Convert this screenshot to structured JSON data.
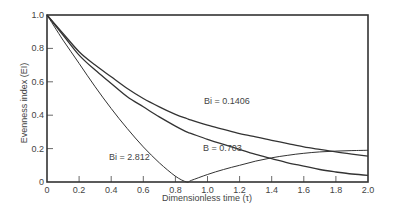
{
  "chart_data": {
    "type": "line",
    "title": "",
    "xlabel": "Dimensionless time (τ)",
    "ylabel": "Evenness index (EI)",
    "xlim": [
      0,
      2.0
    ],
    "ylim": [
      0,
      1.0
    ],
    "grid": false,
    "legend": "none (inline curve labels)",
    "x_ticks": [
      "0",
      "0.2",
      "0.4",
      "0.6",
      "0.8",
      "1.0",
      "1.2",
      "1.4",
      "1.6",
      "1.8",
      "2.0"
    ],
    "y_ticks": [
      "0",
      "0.2",
      "0.4",
      "0.6",
      "0.8",
      "1.0"
    ],
    "x": [
      0,
      0.1,
      0.2,
      0.3,
      0.4,
      0.5,
      0.6,
      0.7,
      0.8,
      0.87,
      0.9,
      1.0,
      1.1,
      1.2,
      1.3,
      1.4,
      1.5,
      1.6,
      1.7,
      1.8,
      1.9,
      2.0
    ],
    "series": [
      {
        "name": "Bi = 0.1406",
        "label_text": "Bi = 0.1406",
        "values": [
          1.0,
          0.89,
          0.78,
          0.7,
          0.63,
          0.56,
          0.5,
          0.45,
          0.405,
          0.38,
          0.37,
          0.34,
          0.315,
          0.29,
          0.27,
          0.25,
          0.23,
          0.21,
          0.195,
          0.18,
          0.167,
          0.155
        ]
      },
      {
        "name": "Bi = 0.703",
        "label_text": "B = 0.703",
        "values": [
          1.0,
          0.88,
          0.76,
          0.67,
          0.59,
          0.51,
          0.45,
          0.39,
          0.335,
          0.3,
          0.29,
          0.255,
          0.225,
          0.195,
          0.165,
          0.14,
          0.115,
          0.095,
          0.075,
          0.06,
          0.048,
          0.04
        ]
      },
      {
        "name": "Bi = 2.812",
        "label_text": "Bi = 2.812",
        "values": [
          1.0,
          0.85,
          0.71,
          0.57,
          0.44,
          0.32,
          0.21,
          0.115,
          0.035,
          0.0,
          0.01,
          0.045,
          0.075,
          0.1,
          0.125,
          0.145,
          0.16,
          0.172,
          0.18,
          0.185,
          0.188,
          0.19
        ]
      }
    ],
    "annotations": [
      {
        "text": "Bi = 0.1406",
        "x": 0.98,
        "y": 0.52
      },
      {
        "text": "B = 0.703",
        "x": 0.97,
        "y": 0.2
      },
      {
        "text": "Bi = 2.812",
        "x": 0.4,
        "y": 0.12
      }
    ],
    "line_color": "#333333"
  },
  "labels": {
    "xlabel": "Dimensionless time (τ)",
    "ylabel": "Evenness index (EI)",
    "curve_0": "Bi = 0.1406",
    "curve_1": "B = 0.703",
    "curve_2": "Bi = 2.812"
  }
}
